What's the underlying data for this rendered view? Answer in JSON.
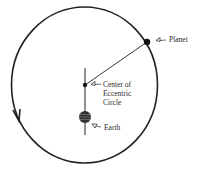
{
  "diagram": {
    "type": "eccentric-circle-model",
    "colors": {
      "line": "#222222",
      "background": "#ffffff",
      "earth": "#333333"
    },
    "labels": {
      "planet": "Planet",
      "center_line1": "Center of",
      "center_line2": "Eccentric",
      "center_line3": "Circle",
      "earth": "Earth"
    },
    "pointer_glyph": "◁–",
    "orbit_direction": "counter-clockwise"
  }
}
